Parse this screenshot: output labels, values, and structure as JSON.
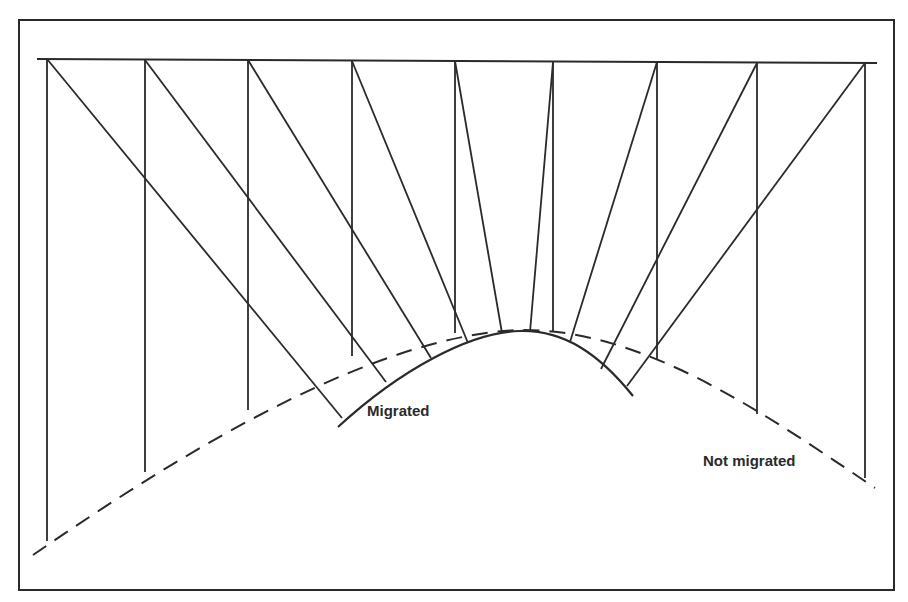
{
  "colors": {
    "background": "#ffffff",
    "ink": "#2a2a2a"
  },
  "labels": {
    "migrated": "Migrated",
    "not_migrated": "Not migrated"
  },
  "frame": {
    "x1": 19,
    "y1": 20,
    "x2": 894,
    "y2": 590
  },
  "surface": {
    "x1": 37,
    "y1": 59,
    "x2": 877,
    "y2": 63
  },
  "stations": [
    {
      "x": 47,
      "top_y": 59,
      "unmigrated_y": 541,
      "migrated_point": [
        342,
        418
      ]
    },
    {
      "x": 145,
      "top_y": 60,
      "unmigrated_y": 472,
      "migrated_point": [
        386,
        382
      ]
    },
    {
      "x": 248,
      "top_y": 60,
      "unmigrated_y": 410,
      "migrated_point": [
        431,
        358
      ]
    },
    {
      "x": 352,
      "top_y": 61,
      "unmigrated_y": 356,
      "migrated_point": [
        468,
        343
      ]
    },
    {
      "x": 455,
      "top_y": 61,
      "unmigrated_y": 333,
      "migrated_point": [
        502,
        333
      ]
    },
    {
      "x": 553,
      "top_y": 62,
      "unmigrated_y": 332,
      "migrated_point": [
        530,
        332
      ]
    },
    {
      "x": 657,
      "top_y": 62,
      "unmigrated_y": 360,
      "migrated_point": [
        570,
        342
      ]
    },
    {
      "x": 757,
      "top_y": 63,
      "unmigrated_y": 414,
      "migrated_point": [
        601,
        369
      ]
    },
    {
      "x": 865,
      "top_y": 63,
      "unmigrated_y": 478,
      "migrated_point": [
        627,
        386
      ]
    }
  ],
  "curves": {
    "not_migrated_path": "M 33 555 C 200 440, 380 335, 520 330 C 640 328, 760 410, 875 488",
    "migrated_path": "M 338 427 C 400 370, 470 332, 520 331 C 565 330, 600 355, 633 396"
  }
}
